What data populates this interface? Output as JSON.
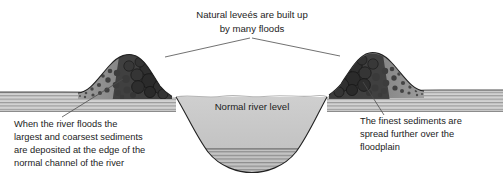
{
  "figure": {
    "background_color": "#ffffff"
  },
  "labels": {
    "top": {
      "line1": "Natural leveés are built up",
      "line2": "by many floods"
    },
    "water": {
      "line1": "Normal river level"
    },
    "left": {
      "line1": "When the river floods the",
      "line2": "largest and coarsest sediments",
      "line3": "are deposited at the edge of the",
      "line4": "normal channel of the river"
    },
    "right": {
      "line1": "The finest sediments are",
      "line2": "spread further over the",
      "line3": "floodplain"
    }
  },
  "colors": {
    "levee_fill": "#8f8f8f",
    "levee_dark": "#3a3a3a",
    "cobble_fill": "#4a4a4a",
    "water_fill": "#c9c9c9",
    "strata_light": "#d6d6d6",
    "strata_dark": "#8a8a8a",
    "outline": "#222222",
    "leader": "#4d4d4d",
    "text": "#1c1c1c"
  },
  "elements": {
    "left_levee": "left-levee-mound",
    "right_levee": "right-levee-mound",
    "channel": "river-channel",
    "water_body": "river-water",
    "floodplain_left": "left-floodplain-strata",
    "floodplain_right": "right-floodplain-strata",
    "channel_bed": "channel-bed-strata"
  }
}
